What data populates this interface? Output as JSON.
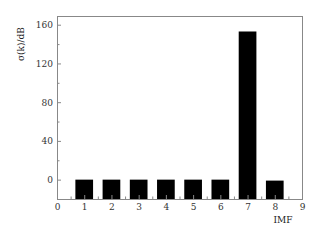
{
  "chart_data": {
    "type": "bar",
    "title": "",
    "xlabel": "IMF",
    "ylabel": "σ(k)/dB",
    "categories": [
      1,
      2,
      3,
      4,
      5,
      6,
      7,
      8
    ],
    "values": [
      0,
      0,
      0,
      0,
      0,
      0,
      153,
      -1
    ],
    "bar_baseline": -20,
    "xlim": [
      0,
      9
    ],
    "ylim": [
      -20,
      169
    ],
    "xticks": [
      0,
      1,
      2,
      3,
      4,
      5,
      6,
      7,
      8,
      9
    ],
    "yticks": [
      0,
      40,
      80,
      120,
      160
    ],
    "y_minor_step": 20,
    "x_minor_step": 0.5,
    "grid": false,
    "legend": null,
    "bar_width": 0.65,
    "bar_color": "#000000",
    "axis_color": "#888888"
  }
}
